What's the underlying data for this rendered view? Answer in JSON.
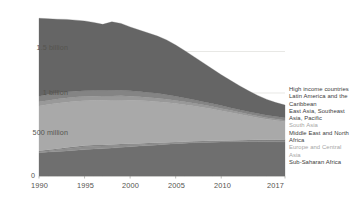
{
  "chart_data": {
    "type": "area",
    "stacked": true,
    "title": "",
    "subtitle": "",
    "xlabel": "",
    "ylabel": "",
    "x": [
      1990,
      1991,
      1992,
      1993,
      1994,
      1995,
      1996,
      1997,
      1998,
      1999,
      2000,
      2001,
      2002,
      2003,
      2004,
      2005,
      2006,
      2007,
      2008,
      2009,
      2010,
      2011,
      2012,
      2013,
      2014,
      2015,
      2016,
      2017
    ],
    "xlim": [
      1990,
      2017
    ],
    "ylim": [
      0,
      2000000000
    ],
    "ytick_values": [
      0,
      500000000,
      1000000000,
      1500000000
    ],
    "ytick_labels": [
      "0",
      "500 million",
      "1 billion",
      "1.5 billion"
    ],
    "xtick_values": [
      1990,
      1995,
      2000,
      2005,
      2010,
      2017
    ],
    "xtick_labels": [
      "1990",
      "1995",
      "2000",
      "2005",
      "2010",
      "2017"
    ],
    "grid": true,
    "grid_axis": "y",
    "legend_position": "right",
    "series": [
      {
        "name": "Sub-Saharan Africa",
        "color": "#6f6f6f",
        "values": [
          280,
          288,
          295,
          302,
          310,
          318,
          325,
          330,
          336,
          345,
          352,
          360,
          368,
          375,
          382,
          390,
          396,
          401,
          405,
          408,
          410,
          412,
          413,
          414,
          414,
          413,
          412,
          411
        ]
      },
      {
        "name": "Europe and Central Asia",
        "color": "#8e8e8e",
        "values": [
          10,
          14,
          20,
          26,
          31,
          34,
          33,
          31,
          30,
          28,
          25,
          21,
          18,
          15,
          12,
          10,
          8,
          7,
          6,
          6,
          6,
          6,
          6,
          6,
          6,
          6,
          6,
          6
        ]
      },
      {
        "name": "Middle East and North Africa",
        "color": "#7e7e7e",
        "values": [
          14,
          14,
          14,
          14,
          14,
          14,
          14,
          14,
          14,
          13,
          13,
          12,
          12,
          11,
          11,
          10,
          10,
          10,
          10,
          10,
          10,
          11,
          12,
          14,
          16,
          18,
          20,
          22
        ]
      },
      {
        "name": "South Asia",
        "color": "#a9a9a9",
        "values": [
          540,
          545,
          548,
          548,
          546,
          542,
          540,
          538,
          535,
          530,
          524,
          516,
          505,
          495,
          480,
          462,
          444,
          424,
          404,
          382,
          360,
          336,
          312,
          288,
          266,
          248,
          232,
          218
        ]
      },
      {
        "name": "East Asia, Southeast Asia, Pacific",
        "color": "#999999",
        "values": [
          50,
          50,
          50,
          50,
          50,
          50,
          50,
          50,
          50,
          50,
          48,
          46,
          44,
          42,
          40,
          38,
          36,
          34,
          32,
          30,
          28,
          26,
          24,
          22,
          20,
          18,
          17,
          16
        ]
      },
      {
        "name": "Latin America and the Caribbean",
        "color": "#848484",
        "values": [
          68,
          70,
          72,
          72,
          71,
          70,
          68,
          66,
          66,
          66,
          64,
          62,
          60,
          58,
          55,
          50,
          46,
          42,
          38,
          36,
          34,
          32,
          31,
          30,
          30,
          30,
          30,
          30
        ]
      },
      {
        "name": "High income countries",
        "color": "#656565",
        "values": [
          938,
          915,
          890,
          875,
          856,
          840,
          820,
          798,
          826,
          806,
          770,
          742,
          716,
          690,
          660,
          618,
          570,
          520,
          470,
          420,
          372,
          330,
          290,
          252,
          218,
          190,
          168,
          152
        ]
      }
    ],
    "series_order_top_to_bottom": [
      "High income countries",
      "Latin America and the Caribbean",
      "East Asia, Southeast Asia, Pacific",
      "South Asia",
      "Middle East and North Africa",
      "Europe and Central Asia",
      "Sub-Saharan Africa"
    ],
    "value_unit": "millions of people",
    "totals": [
      1900,
      1896,
      1889,
      1887,
      1878,
      1868,
      1850,
      1827,
      1857,
      1838,
      1796,
      1759,
      1723,
      1686,
      1640,
      1578,
      1510,
      1438,
      1365,
      1292,
      1220,
      1153,
      1088,
      1026,
      970,
      923,
      885,
      855
    ],
    "colors": {
      "grid": "#d8d8d4",
      "axis_text": "#55544f",
      "background": "#ffffff"
    }
  },
  "legend": {
    "items": [
      {
        "label": "High income countries",
        "color": "#3c3c3c"
      },
      {
        "label": "Latin America and the Caribbean",
        "color": "#3c3c3c"
      },
      {
        "label": "East Asia, Southeast Asia, Pacific",
        "color": "#3c3c3c"
      },
      {
        "label": "South Asia",
        "color": "#a6a6a6"
      },
      {
        "label": "Middle East and North Africa",
        "color": "#3c3c3c"
      },
      {
        "label": "Europe and Central Asia",
        "color": "#a6a6a6"
      },
      {
        "label": "Sub-Saharan Africa",
        "color": "#3c3c3c"
      }
    ]
  },
  "axis": {
    "y_labels": [
      "1.5 billion",
      "1 billion",
      "500 million",
      "0"
    ],
    "x_labels": [
      "1990",
      "1995",
      "2000",
      "2005",
      "2010",
      "2017"
    ]
  }
}
